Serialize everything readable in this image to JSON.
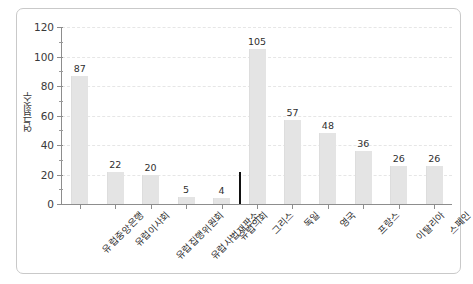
{
  "chart_data": {
    "type": "bar",
    "title": "",
    "xlabel": "",
    "ylabel": "연급횟수",
    "ylim": [
      0,
      120
    ],
    "ytick_step": 20,
    "yticks": [
      0,
      20,
      40,
      60,
      80,
      100,
      120
    ],
    "yticklabels": [
      "0",
      "20",
      "40",
      "60",
      "80",
      "100",
      "120"
    ],
    "grid": true,
    "grid_axis": "y",
    "grid_style": "dashed",
    "legend": "none",
    "bar_color": "#e4e4e4",
    "categories": [
      "유럽중앙은행",
      "유럽이사회",
      "유럽집행위원회",
      "유럽사법재판소",
      "유럽의회",
      "그리스",
      "독일",
      "영국",
      "프랑스",
      "이탈리아",
      "스페인"
    ],
    "values": [
      87,
      22,
      20,
      5,
      4,
      105,
      57,
      48,
      36,
      26,
      26
    ],
    "value_labels": [
      "87",
      "22",
      "20",
      "5",
      "4",
      "105",
      "57",
      "48",
      "36",
      "26",
      "26"
    ],
    "annotations": [
      {
        "name": "group-divider",
        "type": "vertical-line",
        "color": "#111111",
        "after_category_index": 4,
        "label": ""
      }
    ]
  }
}
